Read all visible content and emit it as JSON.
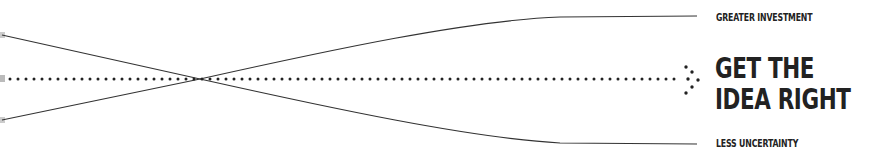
{
  "diagram": {
    "upper_label": "GREATER INVESTMENT",
    "headline": {
      "line1": "GET THE",
      "line2": "IDEA RIGHT"
    },
    "lower_label": "LESS UNCERTAINTY",
    "colors": {
      "ink": "#222222",
      "line": "#333333",
      "background": "#ffffff",
      "fade": "#bbbbbb"
    },
    "icons": {
      "arrow": "dotted-arrow-head"
    }
  }
}
